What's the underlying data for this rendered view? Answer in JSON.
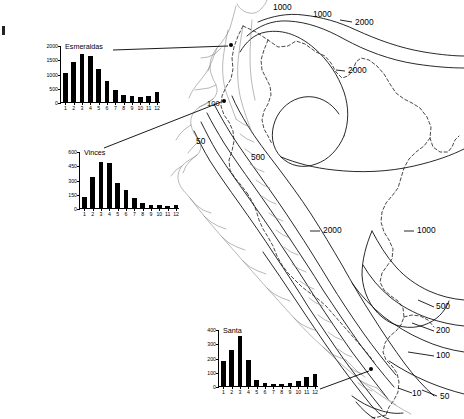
{
  "figure": {
    "type": "isohyet-map-with-inset-bar-charts",
    "region": "Ecuador and northern Peru Pacific coast",
    "contour_quantity": "mean annual precipitation (mm)"
  },
  "chart_data": [
    {
      "id": "esmeraldas",
      "type": "bar",
      "title": "Esmeraldas",
      "categories": [
        "1",
        "2",
        "3",
        "4",
        "5",
        "6",
        "7",
        "8",
        "9",
        "10",
        "11",
        "12"
      ],
      "values": [
        1050,
        1430,
        1730,
        1650,
        1180,
        760,
        450,
        270,
        230,
        215,
        240,
        370
      ],
      "xlabel": "",
      "ylabel": "",
      "ylim": [
        0,
        2000
      ],
      "yticks": [
        0,
        500,
        1000,
        1500,
        2000
      ],
      "grid": false,
      "legend": "none"
    },
    {
      "id": "vinces",
      "type": "bar",
      "title": "Vinces",
      "categories": [
        "1",
        "2",
        "3",
        "4",
        "5",
        "6",
        "7",
        "8",
        "9",
        "10",
        "11",
        "12"
      ],
      "values": [
        130,
        340,
        490,
        480,
        270,
        205,
        120,
        60,
        40,
        38,
        35,
        45
      ],
      "xlabel": "",
      "ylabel": "",
      "ylim": [
        0,
        600
      ],
      "yticks": [
        0,
        150,
        300,
        450,
        600
      ],
      "grid": false,
      "legend": "none"
    },
    {
      "id": "santa",
      "type": "bar",
      "title": "Santa",
      "categories": [
        "1",
        "2",
        "3",
        "4",
        "5",
        "6",
        "7",
        "8",
        "9",
        "10",
        "11",
        "12"
      ],
      "values": [
        185,
        262,
        358,
        190,
        50,
        28,
        22,
        20,
        25,
        42,
        68,
        88
      ],
      "xlabel": "",
      "ylabel": "",
      "ylim": [
        0,
        400
      ],
      "yticks": [
        0,
        100,
        200,
        300,
        400
      ],
      "grid": false,
      "legend": "none"
    }
  ],
  "map": {
    "contour_labels": [
      {
        "id": "c-1000-a",
        "text": "1000",
        "x": 273,
        "y": 8
      },
      {
        "id": "c-1000-b",
        "text": "1000",
        "x": 313,
        "y": 14
      },
      {
        "id": "c-2000-a",
        "text": "2000",
        "x": 355,
        "y": 22
      },
      {
        "id": "c-2000-b",
        "text": "2000",
        "x": 348,
        "y": 71
      },
      {
        "id": "c-2000-c",
        "text": "2000",
        "x": 323,
        "y": 231
      },
      {
        "id": "c-1000-c",
        "text": "1000",
        "x": 417,
        "y": 231
      },
      {
        "id": "c-500-a",
        "text": "500",
        "x": 251,
        "y": 158
      },
      {
        "id": "c-50-a",
        "text": "50",
        "x": 196,
        "y": 141
      },
      {
        "id": "c-100-a",
        "text": "100",
        "x": 209,
        "y": 104
      },
      {
        "id": "c-500-b",
        "text": "500",
        "x": 438,
        "y": 308
      },
      {
        "id": "c-200-a",
        "text": "200",
        "x": 438,
        "y": 332
      },
      {
        "id": "c-100-b",
        "text": "100",
        "x": 438,
        "y": 357
      },
      {
        "id": "c-10-a",
        "text": "10",
        "x": 415,
        "y": 394
      },
      {
        "id": "c-50-b",
        "text": "50",
        "x": 441,
        "y": 397
      }
    ],
    "stations": [
      {
        "id": "station-esmeraldas",
        "label": "Esmeraldas",
        "x": 231,
        "y": 45
      },
      {
        "id": "station-vinces",
        "label": "Vinces",
        "x": 224,
        "y": 101
      },
      {
        "id": "station-santa",
        "label": "Santa",
        "x": 371,
        "y": 369
      }
    ]
  }
}
